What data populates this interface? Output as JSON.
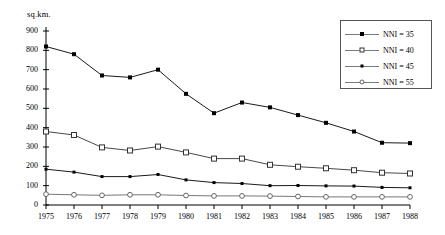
{
  "chart_data": {
    "type": "line",
    "title": "",
    "xlabel": "",
    "ylabel": "sq.km.",
    "x": [
      1975,
      1976,
      1977,
      1978,
      1979,
      1980,
      1981,
      1982,
      1983,
      1984,
      1985,
      1986,
      1987,
      1988
    ],
    "xtick_labels": [
      "1975",
      "1976",
      "1977",
      "1978",
      "1979",
      "1980",
      "1981",
      "1982",
      "1983",
      "1984",
      "1985",
      "1986",
      "1987",
      "1988"
    ],
    "ytick_labels": [
      "0",
      "100",
      "200",
      "300",
      "400",
      "500",
      "600",
      "700",
      "800",
      "900"
    ],
    "yticks": [
      0,
      100,
      200,
      300,
      400,
      500,
      600,
      700,
      800,
      900
    ],
    "ylim": [
      0,
      900
    ],
    "xlim": [
      1975,
      1988
    ],
    "grid": false,
    "legend_position": "top-right",
    "series": [
      {
        "name": "NNI = 35",
        "marker": "filled-square",
        "color": "#000000",
        "values": [
          820,
          780,
          670,
          660,
          700,
          575,
          475,
          530,
          505,
          465,
          425,
          380,
          322,
          320
        ]
      },
      {
        "name": "NNI = 40",
        "marker": "open-square",
        "color": "#333333",
        "values": [
          380,
          362,
          298,
          282,
          302,
          272,
          240,
          240,
          208,
          198,
          190,
          180,
          167,
          163
        ]
      },
      {
        "name": "NNI = 45",
        "marker": "filled-square-small",
        "color": "#000000",
        "values": [
          185,
          170,
          147,
          147,
          158,
          130,
          116,
          111,
          100,
          101,
          99,
          98,
          91,
          89
        ]
      },
      {
        "name": "NNI = 55",
        "marker": "open-circle",
        "color": "#666666",
        "values": [
          56,
          53,
          50,
          53,
          53,
          49,
          47,
          47,
          46,
          44,
          42,
          42,
          42,
          42
        ]
      }
    ]
  },
  "legend": {
    "items": [
      {
        "label": "NNI = 35"
      },
      {
        "label": "NNI = 40"
      },
      {
        "label": "NNI = 45"
      },
      {
        "label": "NNI = 55"
      }
    ]
  },
  "axis": {
    "y_title": "sq.km."
  }
}
